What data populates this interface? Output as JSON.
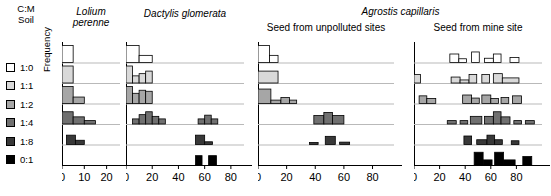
{
  "legend": {
    "header_line1": "C:M",
    "header_line2": "Soil",
    "items": [
      {
        "label": "1:0",
        "color": "#ffffff"
      },
      {
        "label": "1:1",
        "color": "#d9d9d9"
      },
      {
        "label": "1:2",
        "color": "#a6a6a6"
      },
      {
        "label": "1:4",
        "color": "#707070"
      },
      {
        "label": "1:8",
        "color": "#383838"
      },
      {
        "label": "0:1",
        "color": "#000000"
      }
    ]
  },
  "axes": {
    "ylabel": "Frequency"
  },
  "group_title": "Agrostis capillaris",
  "chart_data": {
    "type": "bar",
    "title": "",
    "xlabel": "",
    "ylabel": "Frequency",
    "grid": false,
    "legend_position": "left",
    "series_colors": [
      "#ffffff",
      "#d9d9d9",
      "#a6a6a6",
      "#707070",
      "#383838",
      "#000000"
    ],
    "row_categories": [
      "1:0",
      "1:1",
      "1:2",
      "1:4",
      "1:8",
      "0:1"
    ],
    "panels": [
      {
        "title": "Lolium perenne",
        "title_lines": [
          "Lolium",
          "perenne"
        ],
        "subtitle": "",
        "xlim": [
          0,
          26
        ],
        "xticks": [
          0,
          10,
          20
        ],
        "xtick_labels": [
          "0",
          "10",
          "20"
        ],
        "bin_width": 5,
        "rows": [
          {
            "category": "1:0",
            "color": "#ffffff",
            "bins": [
              {
                "x0": 0,
                "x1": 5,
                "h": 1.0
              }
            ]
          },
          {
            "category": "1:1",
            "color": "#d9d9d9",
            "bins": [
              {
                "x0": 0,
                "x1": 5,
                "h": 1.0
              }
            ]
          },
          {
            "category": "1:2",
            "color": "#a6a6a6",
            "bins": [
              {
                "x0": 0,
                "x1": 5,
                "h": 1.0
              },
              {
                "x0": 5,
                "x1": 10,
                "h": 0.38
              }
            ]
          },
          {
            "category": "1:4",
            "color": "#707070",
            "bins": [
              {
                "x0": 0,
                "x1": 5,
                "h": 0.72
              },
              {
                "x0": 5,
                "x1": 10,
                "h": 0.42
              },
              {
                "x0": 10,
                "x1": 15,
                "h": 0.2
              }
            ]
          },
          {
            "category": "1:8",
            "color": "#383838",
            "bins": [
              {
                "x0": 2,
                "x1": 6,
                "h": 0.55
              },
              {
                "x0": 6,
                "x1": 10,
                "h": 0.25
              }
            ]
          },
          {
            "category": "0:1",
            "color": "#000000",
            "bins": []
          }
        ]
      },
      {
        "title": "Dactylis glomerata",
        "title_lines": [
          "Dactylis glomerata"
        ],
        "subtitle": "",
        "xlim": [
          0,
          90
        ],
        "xticks": [
          0,
          20,
          40,
          60,
          80
        ],
        "xtick_labels": [
          "0",
          "20",
          "40",
          "60",
          "80"
        ],
        "bin_width": 5,
        "rows": [
          {
            "category": "1:0",
            "color": "#ffffff",
            "bins": [
              {
                "x0": 0,
                "x1": 10,
                "h": 1.0
              },
              {
                "x0": 10,
                "x1": 20,
                "h": 0.42
              }
            ]
          },
          {
            "category": "1:1",
            "color": "#d9d9d9",
            "bins": [
              {
                "x0": 0,
                "x1": 5,
                "h": 1.0
              },
              {
                "x0": 5,
                "x1": 10,
                "h": 0.42
              },
              {
                "x0": 10,
                "x1": 15,
                "h": 0.55
              },
              {
                "x0": 15,
                "x1": 20,
                "h": 0.7
              }
            ]
          },
          {
            "category": "1:2",
            "color": "#a6a6a6",
            "bins": [
              {
                "x0": 0,
                "x1": 5,
                "h": 1.0
              },
              {
                "x0": 5,
                "x1": 10,
                "h": 0.6
              },
              {
                "x0": 10,
                "x1": 15,
                "h": 0.78
              },
              {
                "x0": 15,
                "x1": 20,
                "h": 0.72
              }
            ]
          },
          {
            "category": "1:4",
            "color": "#707070",
            "bins": [
              {
                "x0": 5,
                "x1": 10,
                "h": 0.3
              },
              {
                "x0": 10,
                "x1": 15,
                "h": 0.55
              },
              {
                "x0": 15,
                "x1": 20,
                "h": 0.72
              },
              {
                "x0": 20,
                "x1": 25,
                "h": 0.45
              },
              {
                "x0": 25,
                "x1": 30,
                "h": 0.3
              },
              {
                "x0": 55,
                "x1": 60,
                "h": 0.3
              },
              {
                "x0": 60,
                "x1": 65,
                "h": 0.52
              },
              {
                "x0": 65,
                "x1": 70,
                "h": 0.3
              }
            ]
          },
          {
            "category": "1:8",
            "color": "#383838",
            "bins": [
              {
                "x0": 53,
                "x1": 60,
                "h": 0.55
              },
              {
                "x0": 60,
                "x1": 66,
                "h": 0.16
              }
            ]
          },
          {
            "category": "0:1",
            "color": "#000000",
            "bins": [
              {
                "x0": 53,
                "x1": 58,
                "h": 0.55
              },
              {
                "x0": 63,
                "x1": 69,
                "h": 0.55
              }
            ]
          }
        ]
      },
      {
        "title": "",
        "title_lines": [],
        "subtitle": "Seed from unpolluted sites",
        "xlim": [
          0,
          95
        ],
        "xticks": [
          0,
          20,
          40,
          60,
          80
        ],
        "xtick_labels": [
          "0",
          "20",
          "40",
          "60",
          "80"
        ],
        "bin_width": 5,
        "rows": [
          {
            "category": "1:0",
            "color": "#ffffff",
            "bins": [
              {
                "x0": 0,
                "x1": 8,
                "h": 1.0
              },
              {
                "x0": 8,
                "x1": 14,
                "h": 0.42
              }
            ]
          },
          {
            "category": "1:1",
            "color": "#d9d9d9",
            "bins": [
              {
                "x0": 0,
                "x1": 14,
                "h": 0.7
              }
            ]
          },
          {
            "category": "1:2",
            "color": "#a6a6a6",
            "bins": [
              {
                "x0": 0,
                "x1": 9,
                "h": 0.85
              },
              {
                "x0": 9,
                "x1": 16,
                "h": 0.2
              },
              {
                "x0": 16,
                "x1": 22,
                "h": 0.35
              },
              {
                "x0": 22,
                "x1": 27,
                "h": 0.2
              }
            ]
          },
          {
            "category": "1:4",
            "color": "#707070",
            "bins": [
              {
                "x0": 39,
                "x1": 46,
                "h": 0.5
              },
              {
                "x0": 46,
                "x1": 52,
                "h": 0.68
              },
              {
                "x0": 52,
                "x1": 60,
                "h": 0.5
              }
            ]
          },
          {
            "category": "1:8",
            "color": "#383838",
            "bins": [
              {
                "x0": 36,
                "x1": 42,
                "h": 0.12
              },
              {
                "x0": 47,
                "x1": 54,
                "h": 0.48
              },
              {
                "x0": 57,
                "x1": 64,
                "h": 0.14
              }
            ]
          },
          {
            "category": "0:1",
            "color": "#000000",
            "bins": []
          }
        ]
      },
      {
        "title": "",
        "title_lines": [],
        "subtitle": "Seed from mine site",
        "xlim": [
          0,
          100
        ],
        "xticks": [
          0,
          20,
          40,
          60,
          80
        ],
        "xtick_labels": [
          "0",
          "20",
          "40",
          "60",
          "80"
        ],
        "bin_width": 5,
        "rows": [
          {
            "category": "1:0",
            "color": "#ffffff",
            "bins": [
              {
                "x0": 28,
                "x1": 35,
                "h": 0.5
              },
              {
                "x0": 35,
                "x1": 41,
                "h": 0.22
              },
              {
                "x0": 45,
                "x1": 51,
                "h": 0.62
              },
              {
                "x0": 55,
                "x1": 62,
                "h": 0.25
              },
              {
                "x0": 62,
                "x1": 68,
                "h": 0.5
              },
              {
                "x0": 75,
                "x1": 82,
                "h": 0.3
              }
            ]
          },
          {
            "category": "1:1",
            "color": "#d9d9d9",
            "bins": [
              {
                "x0": 0,
                "x1": 5,
                "h": 0.5
              },
              {
                "x0": 29,
                "x1": 36,
                "h": 0.35
              },
              {
                "x0": 36,
                "x1": 43,
                "h": 0.18
              },
              {
                "x0": 43,
                "x1": 49,
                "h": 0.5
              },
              {
                "x0": 53,
                "x1": 59,
                "h": 0.5
              },
              {
                "x0": 62,
                "x1": 69,
                "h": 0.55
              },
              {
                "x0": 69,
                "x1": 82,
                "h": 0.3
              }
            ]
          },
          {
            "category": "1:2",
            "color": "#a6a6a6",
            "bins": [
              {
                "x0": 4,
                "x1": 10,
                "h": 0.45
              },
              {
                "x0": 10,
                "x1": 17,
                "h": 0.3
              },
              {
                "x0": 38,
                "x1": 45,
                "h": 0.5
              },
              {
                "x0": 45,
                "x1": 51,
                "h": 0.32
              },
              {
                "x0": 53,
                "x1": 60,
                "h": 0.5
              },
              {
                "x0": 60,
                "x1": 66,
                "h": 0.3
              },
              {
                "x0": 68,
                "x1": 74,
                "h": 0.35
              },
              {
                "x0": 77,
                "x1": 84,
                "h": 0.45
              }
            ]
          },
          {
            "category": "1:4",
            "color": "#707070",
            "bins": [
              {
                "x0": 26,
                "x1": 33,
                "h": 0.2
              },
              {
                "x0": 36,
                "x1": 42,
                "h": 0.2
              },
              {
                "x0": 44,
                "x1": 53,
                "h": 0.45
              },
              {
                "x0": 55,
                "x1": 62,
                "h": 0.45
              },
              {
                "x0": 62,
                "x1": 68,
                "h": 0.72
              },
              {
                "x0": 68,
                "x1": 75,
                "h": 0.42
              },
              {
                "x0": 78,
                "x1": 84,
                "h": 0.2
              },
              {
                "x0": 87,
                "x1": 94,
                "h": 0.2
              }
            ]
          },
          {
            "category": "1:8",
            "color": "#383838",
            "bins": [
              {
                "x0": 39,
                "x1": 45,
                "h": 0.5
              },
              {
                "x0": 49,
                "x1": 57,
                "h": 0.28
              },
              {
                "x0": 57,
                "x1": 63,
                "h": 0.55
              },
              {
                "x0": 63,
                "x1": 69,
                "h": 0.28
              },
              {
                "x0": 76,
                "x1": 82,
                "h": 0.22
              }
            ]
          },
          {
            "category": "0:1",
            "color": "#000000",
            "bins": [
              {
                "x0": 47,
                "x1": 54,
                "h": 0.75
              },
              {
                "x0": 54,
                "x1": 61,
                "h": 0.3
              },
              {
                "x0": 63,
                "x1": 70,
                "h": 0.75
              },
              {
                "x0": 70,
                "x1": 79,
                "h": 0.3
              },
              {
                "x0": 85,
                "x1": 92,
                "h": 0.5
              }
            ]
          }
        ]
      }
    ]
  }
}
